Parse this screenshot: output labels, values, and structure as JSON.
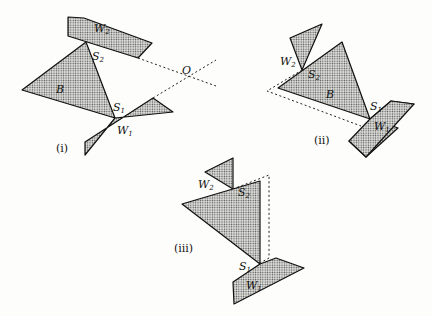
{
  "figure": {
    "panels": [
      {
        "id": "i",
        "caption": "(i)",
        "labels": {
          "wall_top": "W",
          "wall_top_sub": "2",
          "wall_bottom": "W",
          "wall_bottom_sub": "1",
          "contact_top": "S",
          "contact_top_sub": "2",
          "contact_bottom": "S",
          "contact_bottom_sub": "1",
          "body": "B",
          "point": "O"
        }
      },
      {
        "id": "ii",
        "caption": "(ii)",
        "labels": {
          "wall_top": "W",
          "wall_top_sub": "2",
          "wall_bottom": "W",
          "wall_bottom_sub": "1",
          "contact_top": "S",
          "contact_top_sub": "2",
          "contact_bottom": "S",
          "contact_bottom_sub": "1",
          "body": "B"
        }
      },
      {
        "id": "iii",
        "caption": "(iii)",
        "labels": {
          "wall_top": "W",
          "wall_top_sub": "2",
          "wall_bottom": "W",
          "wall_bottom_sub": "1",
          "contact_top": "S",
          "contact_top_sub": "2",
          "contact_bottom": "S",
          "contact_bottom_sub": "1"
        }
      }
    ]
  }
}
